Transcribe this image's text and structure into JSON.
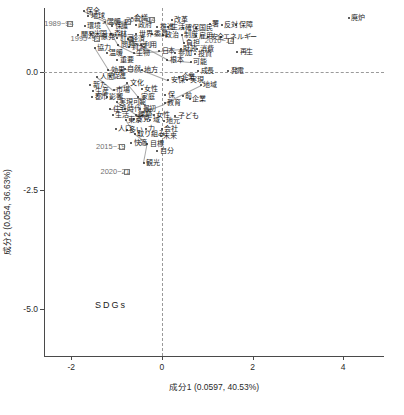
{
  "chart_data": {
    "type": "scatter",
    "title": "",
    "xlabel": "成分1 (0.0597, 40.53%)",
    "ylabel": "成分2 (0.054, 36.63%)",
    "xlim": [
      -2.6,
      4.9
    ],
    "ylim": [
      -6.0,
      1.35
    ],
    "xticks": [
      "-2",
      "0",
      "2",
      "4"
    ],
    "xtickvals": [
      -2,
      0,
      2,
      4
    ],
    "yticks": [
      "0.0",
      "-2.5",
      "-5.0"
    ],
    "ytickvals": [
      0.0,
      -2.5,
      -5.0
    ],
    "grid": false,
    "reference_lines": {
      "h": 0.0,
      "v": 0.0
    },
    "legend": "",
    "annotation_corner": "SDGs",
    "groups": [
      {
        "label": "1989~94",
        "x": -2.02,
        "y": 1.02,
        "marker": "square"
      },
      {
        "label": "1995~99",
        "x": -1.44,
        "y": 0.7,
        "marker": "square"
      },
      {
        "label": "2005~09",
        "x": -0.74,
        "y": 1.05,
        "marker": "square"
      },
      {
        "label": "2000~04",
        "x": -0.22,
        "y": 1.1,
        "marker": "square"
      },
      {
        "label": "2010~14",
        "x": 1.52,
        "y": 0.66,
        "marker": "square"
      },
      {
        "label": "2015~19",
        "x": -0.88,
        "y": -1.58,
        "marker": "square"
      },
      {
        "label": "2020~21",
        "x": -0.78,
        "y": -2.12,
        "marker": "square"
      }
    ],
    "words": [
      {
        "t": "保全",
        "x": -1.72,
        "y": 1.28
      },
      {
        "t": "地球",
        "x": -1.62,
        "y": 1.18
      },
      {
        "t": "環境",
        "x": -1.7,
        "y": 0.96
      },
      {
        "t": "温暖",
        "x": -1.26,
        "y": 1.06
      },
      {
        "t": "保護",
        "x": -1.1,
        "y": 0.98
      },
      {
        "t": "会議",
        "x": -0.66,
        "y": 1.14
      },
      {
        "t": "政府",
        "x": -0.58,
        "y": 1.0
      },
      {
        "t": "改革",
        "x": 0.22,
        "y": 1.1
      },
      {
        "t": "推進",
        "x": -0.1,
        "y": 0.94
      },
      {
        "t": "生活",
        "x": 0.14,
        "y": 0.94
      },
      {
        "t": "確保",
        "x": 0.46,
        "y": 0.92
      },
      {
        "t": "国民",
        "x": 0.76,
        "y": 0.93
      },
      {
        "t": "署",
        "x": 1.06,
        "y": 1.02
      },
      {
        "t": "反対",
        "x": 1.32,
        "y": 1.0
      },
      {
        "t": "保障",
        "x": 1.64,
        "y": 0.99
      },
      {
        "t": "開発",
        "x": -1.84,
        "y": 0.78
      },
      {
        "t": "米国",
        "x": -1.56,
        "y": 0.8
      },
      {
        "t": "森林",
        "x": -1.12,
        "y": 0.8
      },
      {
        "t": "計画",
        "x": -0.98,
        "y": 0.72
      },
      {
        "t": "世界",
        "x": -0.56,
        "y": 0.8
      },
      {
        "t": "委員",
        "x": -0.22,
        "y": 0.8
      },
      {
        "t": "政治",
        "x": 0.02,
        "y": 0.77
      },
      {
        "t": "制度",
        "x": 0.44,
        "y": 0.79
      },
      {
        "t": "雇用",
        "x": 0.76,
        "y": 0.76
      },
      {
        "t": "安全",
        "x": 1.02,
        "y": 0.74
      },
      {
        "t": "エネルギー",
        "x": 1.3,
        "y": 0.73
      },
      {
        "t": "原発",
        "x": -1.4,
        "y": 0.74
      },
      {
        "t": "経済",
        "x": -0.74,
        "y": 0.7
      },
      {
        "t": "協力",
        "x": -1.48,
        "y": 0.5
      },
      {
        "t": "問題",
        "x": -0.96,
        "y": 0.56
      },
      {
        "t": "資源",
        "x": -0.72,
        "y": 0.52
      },
      {
        "t": "利用",
        "x": -0.46,
        "y": 0.56
      },
      {
        "t": "負担",
        "x": 0.48,
        "y": 0.62
      },
      {
        "t": "財政",
        "x": 0.42,
        "y": 0.48
      },
      {
        "t": "消費",
        "x": 0.78,
        "y": 0.48
      },
      {
        "t": "温暖",
        "x": -1.22,
        "y": 0.4
      },
      {
        "t": "生物",
        "x": -0.62,
        "y": 0.4
      },
      {
        "t": "日本",
        "x": -0.06,
        "y": 0.44
      },
      {
        "t": "参加",
        "x": 0.3,
        "y": 0.4
      },
      {
        "t": "投資",
        "x": 0.74,
        "y": 0.38
      },
      {
        "t": "再生",
        "x": 1.66,
        "y": 0.42
      },
      {
        "t": "重要",
        "x": -0.98,
        "y": 0.26
      },
      {
        "t": "根本",
        "x": 0.12,
        "y": 0.26
      },
      {
        "t": "可能",
        "x": 0.64,
        "y": 0.22
      },
      {
        "t": "効果",
        "x": -1.18,
        "y": 0.04
      },
      {
        "t": "自然",
        "x": -0.82,
        "y": 0.06
      },
      {
        "t": "地方",
        "x": -0.44,
        "y": 0.04
      },
      {
        "t": "成長",
        "x": 0.8,
        "y": 0.02
      },
      {
        "t": "発電",
        "x": 1.46,
        "y": 0.02
      },
      {
        "t": "人間",
        "x": -1.42,
        "y": -0.1
      },
      {
        "t": "促進",
        "x": -1.14,
        "y": -0.08
      },
      {
        "t": "企業",
        "x": 0.38,
        "y": -0.1
      },
      {
        "t": "実現",
        "x": 0.56,
        "y": -0.18
      },
      {
        "t": "安保",
        "x": 0.14,
        "y": -0.18
      },
      {
        "t": "新た",
        "x": -1.58,
        "y": -0.28
      },
      {
        "t": "文化",
        "x": -0.76,
        "y": -0.24
      },
      {
        "t": "地域",
        "x": 0.86,
        "y": -0.28
      },
      {
        "t": "生産",
        "x": -1.52,
        "y": -0.4
      },
      {
        "t": "市場",
        "x": -1.06,
        "y": -0.38
      },
      {
        "t": "女性",
        "x": -0.44,
        "y": -0.36
      },
      {
        "t": "都市",
        "x": -1.54,
        "y": -0.52
      },
      {
        "t": "影響",
        "x": -1.22,
        "y": -0.52
      },
      {
        "t": "家庭",
        "x": -0.52,
        "y": -0.52
      },
      {
        "t": "保",
        "x": 0.08,
        "y": -0.48
      },
      {
        "t": "前",
        "x": 0.46,
        "y": -0.5
      },
      {
        "t": "企業",
        "x": 0.62,
        "y": -0.58
      },
      {
        "t": "実現可能",
        "x": -1.0,
        "y": -0.64
      },
      {
        "t": "教育",
        "x": 0.06,
        "y": -0.66
      },
      {
        "t": "住宅",
        "x": -1.14,
        "y": -0.78
      },
      {
        "t": "時代",
        "x": -0.82,
        "y": -0.78
      },
      {
        "t": "最初",
        "x": -0.48,
        "y": -0.78
      },
      {
        "t": "生活",
        "x": -1.08,
        "y": -0.9
      },
      {
        "t": "課題",
        "x": -0.58,
        "y": -0.9
      },
      {
        "t": "女性",
        "x": -0.18,
        "y": -0.92
      },
      {
        "t": "子ども",
        "x": 0.3,
        "y": -0.94
      },
      {
        "t": "東京",
        "x": -0.8,
        "y": -1.02
      },
      {
        "t": "意見",
        "x": -0.62,
        "y": -1.0
      },
      {
        "t": "域",
        "x": -0.26,
        "y": -1.02
      },
      {
        "t": "地元",
        "x": 0.04,
        "y": -1.04
      },
      {
        "t": "人口",
        "x": -1.02,
        "y": -1.2
      },
      {
        "t": "多い",
        "x": -0.78,
        "y": -1.22
      },
      {
        "t": "力",
        "x": -0.36,
        "y": -1.2
      },
      {
        "t": "会社",
        "x": 0.0,
        "y": -1.2
      },
      {
        "t": "取り組み",
        "x": -0.6,
        "y": -1.32
      },
      {
        "t": "未来",
        "x": -0.02,
        "y": -1.36
      },
      {
        "t": "快適",
        "x": -0.68,
        "y": -1.5
      },
      {
        "t": "目標",
        "x": -0.32,
        "y": -1.52
      },
      {
        "t": "自分",
        "x": -0.1,
        "y": -1.66
      },
      {
        "t": "観光",
        "x": -0.4,
        "y": -1.92
      },
      {
        "t": "廃炉",
        "x": 4.12,
        "y": 1.14
      }
    ]
  }
}
